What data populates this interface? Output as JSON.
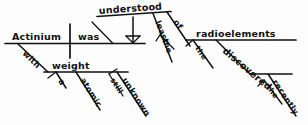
{
  "diagram": {
    "type": "reed-kellogg-sentence-diagram",
    "sentence": "Actinium, with a still unknown atomic weight, was the least understood of the recently discovered radioelements.",
    "ink_color": "#111111",
    "background_color": "#fdfdfd",
    "words": {
      "subject": "Actinium",
      "verb": "was",
      "preposition_with": "with",
      "object_weight": "weight",
      "article_a": "a",
      "adj_atomic": "atomic",
      "adj_unknown": "unknown",
      "adv_still": "still",
      "complement_understood": "understood",
      "adv_least": "least",
      "article_the_least": "the",
      "preposition_of": "of",
      "object_radioelements": "radioelements",
      "article_the_radio": "the",
      "participle_discovered": "discovered",
      "article_the_disc": "the",
      "adv_recently": "recently"
    }
  }
}
